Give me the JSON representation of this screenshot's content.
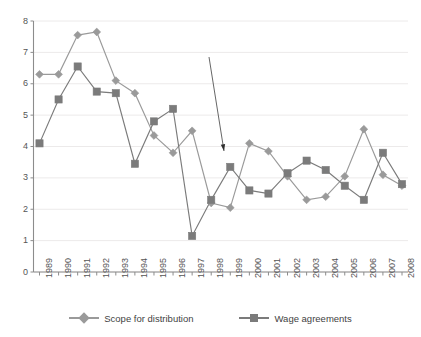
{
  "chart_data": {
    "type": "line",
    "title": "",
    "xlabel": "",
    "ylabel": "",
    "categories": [
      "1989",
      "1990",
      "1991",
      "1992",
      "1993",
      "1994",
      "1995",
      "1996",
      "1997",
      "1998",
      "1999",
      "2000",
      "2001",
      "2002",
      "2003",
      "2004",
      "2005",
      "2006",
      "2007",
      "2008"
    ],
    "ylim": [
      0,
      8
    ],
    "yticks": [
      0,
      1,
      2,
      3,
      4,
      5,
      6,
      7,
      8
    ],
    "ytick_labels": [
      "0",
      "1",
      "2",
      "3",
      "4",
      "5",
      "6",
      "7",
      "8"
    ],
    "grid": true,
    "legend_position": "bottom",
    "series": [
      {
        "name": "Scope for distribution",
        "marker": "diamond",
        "color": "#9a9a9a",
        "values": [
          6.3,
          6.3,
          7.55,
          7.65,
          6.1,
          5.7,
          4.35,
          3.8,
          4.5,
          2.2,
          2.05,
          4.1,
          3.85,
          3.05,
          2.3,
          2.4,
          3.05,
          4.55,
          3.1,
          2.75
        ]
      },
      {
        "name": "Wage agreements",
        "marker": "square",
        "color": "#7b7b7b",
        "values": [
          4.1,
          5.5,
          6.55,
          5.75,
          5.7,
          3.45,
          4.8,
          5.2,
          1.15,
          2.3,
          3.35,
          2.6,
          2.5,
          3.15,
          3.55,
          3.25,
          2.75,
          2.3,
          3.8,
          2.8
        ]
      }
    ],
    "annotations": [
      {
        "type": "arrow",
        "label": "",
        "from_x": 209,
        "from_y": 57,
        "to_x": 224,
        "to_y": 151,
        "color": "#555555"
      }
    ]
  },
  "axis": {
    "y_axis_name": "value-axis",
    "x_axis_name": "year-axis"
  },
  "legend": {
    "items": [
      {
        "label": "Scope for distribution",
        "marker": "diamond",
        "color": "#9a9a9a"
      },
      {
        "label": "Wage agreements",
        "marker": "square",
        "color": "#7b7b7b"
      }
    ]
  },
  "colors": {
    "background": "#ffffff",
    "grid": "#eceaea",
    "axis": "#8c8c8c",
    "series_1": "#9a9a9a",
    "series_2": "#7b7b7b",
    "text": "#4a4a4a"
  }
}
